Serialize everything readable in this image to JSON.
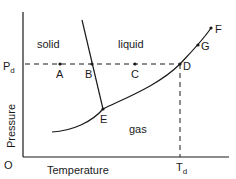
{
  "diagram": {
    "axes": {
      "y_label": "Pressure",
      "x_label": "Temperature",
      "origin": "O",
      "pressure_tick": "P",
      "pressure_tick_sub": "d",
      "temperature_tick": "T",
      "temperature_tick_sub": "d"
    },
    "regions": {
      "solid": "solid",
      "liquid": "liquid",
      "gas": "gas"
    },
    "points": {
      "A": "A",
      "B": "B",
      "C": "C",
      "D": "D",
      "E": "E",
      "F": "F",
      "G": "G"
    },
    "colors": {
      "line": "#1a1a1a",
      "background": "#ffffff"
    }
  }
}
